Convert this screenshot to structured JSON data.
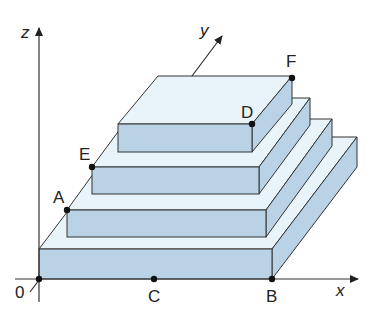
{
  "diagram": {
    "type": "3d-stepped-pyramid",
    "axes": {
      "x": "x",
      "y": "y",
      "z": "z",
      "origin": "0"
    },
    "points": {
      "A": "A",
      "B": "B",
      "C": "C",
      "D": "D",
      "E": "E",
      "F": "F"
    },
    "slab_count": 4,
    "colors": {
      "top_face": "#e8f4f9",
      "side_face": "#b9d2e6",
      "stroke": "#333333"
    }
  }
}
